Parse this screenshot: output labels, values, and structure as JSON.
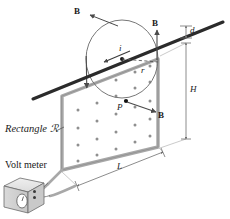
{
  "figure": {
    "type": "physics-diagram"
  },
  "labels": {
    "b_topleft": "B",
    "b_topright": "B",
    "b_point": "B",
    "current": "i",
    "radius": "r",
    "point_p": "P",
    "distance_d": "d",
    "height_h": "H",
    "length_l": "L",
    "rectangle": "Rectangle ℛ",
    "voltmeter": "Volt meter"
  },
  "colors": {
    "wire": "#2b2b2b",
    "loop": "#9a9a9a",
    "circle": "#6f6f6f",
    "arrow": "#4a4a4a",
    "dot": "#8a8a8a",
    "meter_face": "#d8d8d8",
    "meter_top": "#e8e8e8",
    "meter_side": "#bfbfbf",
    "dim": "#6f6f6f",
    "text": "#1a1a1a"
  },
  "geometry": {
    "wire_start": [
      33,
      98
    ],
    "wire_end": [
      222,
      22
    ],
    "circle_center": [
      122,
      59
    ],
    "circle_rx": 36,
    "circle_ry": 38,
    "point_p": [
      126,
      101
    ],
    "rect_corners": [
      [
        60,
        95
      ],
      [
        162,
        56
      ],
      [
        162,
        149
      ],
      [
        60,
        172
      ]
    ],
    "dot_rows": 5,
    "dot_cols": 5
  },
  "annotations": {
    "field_direction": "out-of-page inside loop (dots)",
    "current_direction": "leftward along wire",
    "b_circulation": "circular around wire"
  }
}
